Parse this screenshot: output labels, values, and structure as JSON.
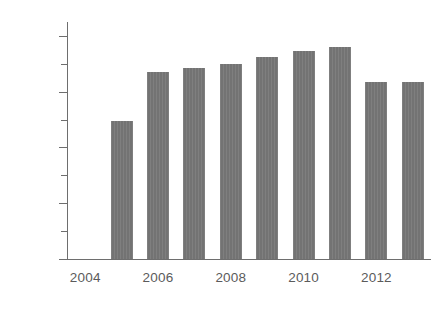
{
  "chart_data": {
    "type": "bar",
    "title": "",
    "subtitle": "",
    "xlabel": "",
    "ylabel": "",
    "categories": [
      "2004",
      "2005",
      "2006",
      "2007",
      "2008",
      "2009",
      "2010",
      "2011",
      "2012",
      "2013"
    ],
    "values": [
      null,
      99,
      134,
      137,
      140,
      145,
      149,
      152,
      127,
      127
    ],
    "series": [
      {
        "name": "",
        "values": [
          null,
          99,
          134,
          137,
          140,
          145,
          149,
          152,
          127,
          127
        ]
      }
    ],
    "ylim": [
      0,
      170
    ],
    "xlim": [
      2003.5,
      2013.5
    ],
    "y_major_ticks": [
      0,
      40,
      80,
      120,
      160
    ],
    "y_minor_ticks": [
      20,
      60,
      100,
      140
    ],
    "y_tick_labels": [
      "0",
      "40",
      "80",
      "120",
      "160"
    ],
    "x_tick_labels": [
      "2004",
      "2006",
      "2008",
      "2010",
      "2012"
    ],
    "x_tick_values": [
      2004,
      2006,
      2008,
      2010,
      2012
    ],
    "grid": false,
    "legend": false,
    "legend_position": "none",
    "bar_color": "#737373",
    "axis_color": "#6e6e6e",
    "text_color": "#5b5b5b",
    "background_color": "#ffffff",
    "annotations": []
  }
}
